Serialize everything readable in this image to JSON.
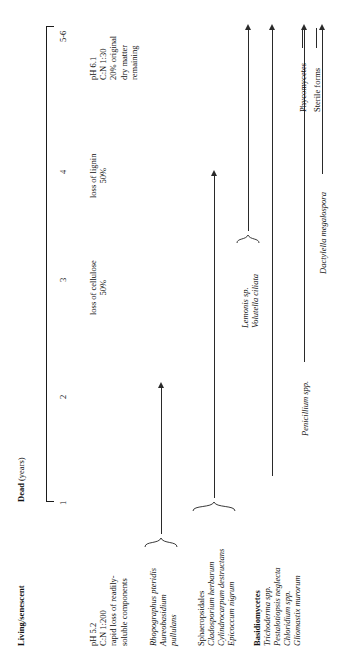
{
  "figure": {
    "orientation": "rotated-90-ccw",
    "caption_absent": true
  },
  "timeline": {
    "phases": [
      {
        "id": "living",
        "label": "Living/senescent"
      },
      {
        "id": "dead",
        "label_bold": "Dead",
        "label_rest": " (years)"
      }
    ],
    "ticks": [
      {
        "value": "1"
      },
      {
        "value": "2"
      },
      {
        "value": "3"
      },
      {
        "value": "4"
      },
      {
        "value": "5-6"
      }
    ]
  },
  "conditions": [
    {
      "id": "living-conditions",
      "lines": [
        "pH 5.2",
        "C:N 1:200",
        "rapid loss of readily-",
        "soluble components"
      ]
    },
    {
      "id": "year3-conditions",
      "lines": [
        "loss of cellulose",
        "50%"
      ]
    },
    {
      "id": "year4-conditions",
      "lines": [
        "loss of lignin",
        "50%"
      ]
    },
    {
      "id": "year56-conditions",
      "lines": [
        "pH 6.1",
        "C:N 1:30",
        "20% original",
        "dry matter",
        "remaining"
      ]
    }
  ],
  "taxa": [
    {
      "id": "rhopographus-aureobasidium",
      "grouped": true,
      "names": [
        "Rhopographus pteridis",
        "Aureobasidium",
        "pullulans"
      ],
      "italic": [
        true,
        true,
        true
      ]
    },
    {
      "id": "sphaeropsidales-group",
      "grouped": true,
      "names": [
        "Sphaeropsidales",
        "Cladosporium herbarum",
        "Cylindrocarpum destructans",
        "Epicoccum nigrum"
      ],
      "italic": [
        false,
        true,
        true,
        true
      ]
    },
    {
      "id": "basidiomycetes-group",
      "grouped": false,
      "names": [
        "Basidiomycetes",
        "Trichoderma spp.",
        "Pestalotiopsis neglecta",
        "Chloridium spp.",
        "Gliomastix murorum"
      ],
      "italic": [
        false,
        true,
        true,
        true,
        true
      ]
    },
    {
      "id": "penicillium",
      "grouped": false,
      "names": [
        "Penicillium spp."
      ],
      "italic": [
        true
      ]
    },
    {
      "id": "lemonis-volutella",
      "grouped": true,
      "names": [
        "Lemonis sp.",
        "Volutella ciliata"
      ],
      "italic": [
        true,
        true
      ]
    },
    {
      "id": "dactylella",
      "grouped": false,
      "names": [
        "Dactylella megalospora"
      ],
      "italic": [
        true
      ]
    },
    {
      "id": "phycomycetes",
      "grouped": false,
      "names": [
        "Phycomycetes"
      ],
      "italic": [
        false
      ]
    },
    {
      "id": "sterile-forms",
      "grouped": false,
      "names": [
        "Sterile forms"
      ],
      "italic": [
        false
      ]
    }
  ],
  "colors": {
    "ink": "#1b1b1b",
    "background": "#ffffff"
  }
}
